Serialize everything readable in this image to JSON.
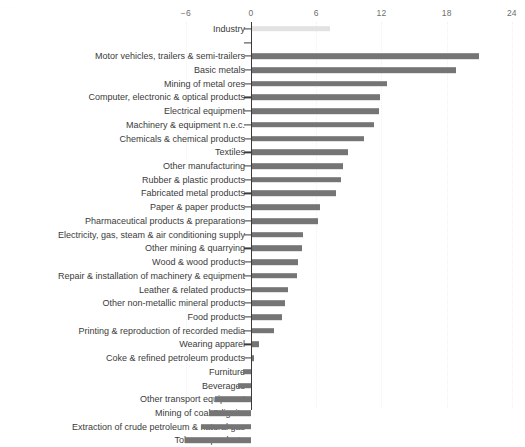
{
  "chart_data": {
    "type": "bar",
    "orientation": "horizontal",
    "title": "",
    "subtitle": "",
    "xlabel": "",
    "ylabel": "",
    "xlim": [
      -6,
      24
    ],
    "xticks": [
      -6,
      0,
      6,
      12,
      18,
      24
    ],
    "xtick_labels": [
      "−6",
      "0",
      "6",
      "12",
      "18",
      "24"
    ],
    "grid": "vertical-dotted",
    "legend": "none",
    "zero_line": true,
    "colors": {
      "total_bar": "#e2e2e2",
      "bar": "#757575",
      "axis": "#3b3b3b",
      "grid": "#f2f2f2",
      "text": "#3b3b3b",
      "tick_label": "#6e6e6e"
    },
    "categories": [
      "Industry",
      "",
      "Motor vehicles, trailers & semi-trailers",
      "Basic metals",
      "Mining of metal ores",
      "Computer, electronic & optical products",
      "Electrical equipment",
      "Machinery & equipment n.e.c.",
      "Chemicals & chemical products",
      "Textiles",
      "Other manufacturing",
      "Rubber & plastic products",
      "Fabricated metal products",
      "Paper & paper products",
      "Pharmaceutical products & preparations",
      "Electricity, gas, steam & air conditioning supply",
      "Other mining & quarrying",
      "Wood & wood products",
      "Repair & installation of machinery & equipment",
      "Leather & related products",
      "Other non-metallic mineral products",
      "Food products",
      "Printing & reproduction of recorded media",
      "Wearing apparel",
      "Coke & refined petroleum products",
      "Furniture",
      "Beverages",
      "Other transport equipment",
      "Mining of coal & lignite",
      "Extraction of crude petroleum & natural gas",
      "Tobacco products"
    ],
    "values": [
      7.2,
      null,
      20.9,
      18.8,
      12.4,
      11.8,
      11.7,
      11.2,
      10.3,
      8.8,
      8.4,
      8.2,
      7.7,
      6.3,
      6.1,
      4.7,
      4.6,
      4.2,
      4.1,
      3.3,
      3.0,
      2.8,
      2.0,
      0.6,
      0.15,
      -0.7,
      -1.2,
      -3.3,
      -3.9,
      -4.6,
      -6.1
    ],
    "highlight_index": 0
  }
}
